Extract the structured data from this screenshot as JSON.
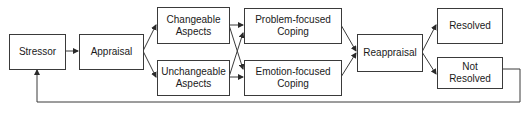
{
  "diagram": {
    "nodes": {
      "stressor": {
        "lines": [
          "Stressor"
        ]
      },
      "appraisal": {
        "lines": [
          "Appraisal"
        ]
      },
      "changeable": {
        "lines": [
          "Changeable",
          "Aspects"
        ]
      },
      "unchangeable": {
        "lines": [
          "Unchangeable",
          "Aspects"
        ]
      },
      "problem": {
        "lines": [
          "Problem-focused",
          "Coping"
        ]
      },
      "emotion": {
        "lines": [
          "Emotion-focused",
          "Coping"
        ]
      },
      "reappraisal": {
        "lines": [
          "Reappraisal"
        ]
      },
      "resolved": {
        "lines": [
          "Resolved"
        ]
      },
      "not_resolved": {
        "lines": [
          "Not",
          "Resolved"
        ]
      }
    },
    "edges": [
      {
        "from": "Stressor",
        "to": "Appraisal"
      },
      {
        "from": "Appraisal",
        "to": "Changeable Aspects"
      },
      {
        "from": "Appraisal",
        "to": "Unchangeable Aspects"
      },
      {
        "from": "Changeable Aspects",
        "to": "Problem-focused Coping"
      },
      {
        "from": "Changeable Aspects",
        "to": "Emotion-focused Coping"
      },
      {
        "from": "Unchangeable Aspects",
        "to": "Problem-focused Coping"
      },
      {
        "from": "Unchangeable Aspects",
        "to": "Emotion-focused Coping"
      },
      {
        "from": "Problem-focused Coping",
        "to": "Reappraisal"
      },
      {
        "from": "Emotion-focused Coping",
        "to": "Reappraisal"
      },
      {
        "from": "Reappraisal",
        "to": "Resolved"
      },
      {
        "from": "Reappraisal",
        "to": "Not Resolved"
      },
      {
        "from": "Not Resolved",
        "to": "Stressor",
        "type": "feedback"
      }
    ],
    "colors": {
      "stroke": "#3a3a3a",
      "text": "#1a1a1a",
      "background": "#ffffff"
    }
  }
}
